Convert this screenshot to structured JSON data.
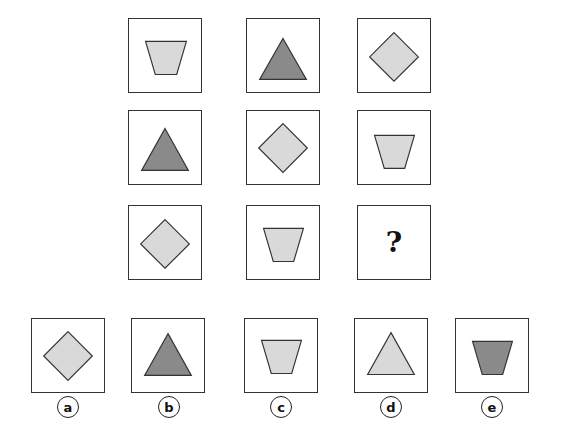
{
  "colors": {
    "light": "#d9d9d9",
    "dark": "#8a8a8a",
    "stroke": "#333333"
  },
  "matrix": [
    {
      "shape": "trapezoid",
      "fill": "light"
    },
    {
      "shape": "triangle",
      "fill": "dark"
    },
    {
      "shape": "diamond",
      "fill": "light"
    },
    {
      "shape": "triangle",
      "fill": "dark"
    },
    {
      "shape": "diamond",
      "fill": "light"
    },
    {
      "shape": "trapezoid",
      "fill": "light"
    },
    {
      "shape": "diamond",
      "fill": "light"
    },
    {
      "shape": "trapezoid",
      "fill": "light"
    },
    {
      "shape": "missing",
      "text": "?"
    }
  ],
  "options": [
    {
      "label": "a",
      "shape": "diamond",
      "fill": "light"
    },
    {
      "label": "b",
      "shape": "triangle",
      "fill": "dark"
    },
    {
      "label": "c",
      "shape": "trapezoid",
      "fill": "light"
    },
    {
      "label": "d",
      "shape": "triangle",
      "fill": "light"
    },
    {
      "label": "e",
      "shape": "trapezoid",
      "fill": "dark"
    }
  ]
}
